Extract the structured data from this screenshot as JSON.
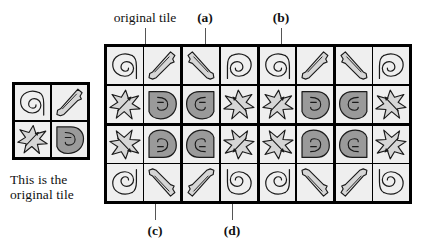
{
  "figure": {
    "legend": {
      "caption_line1": "This is the",
      "caption_line2": "original tile",
      "caption": "This is the original tile",
      "tile_cells": [
        {
          "glyph": "spiral",
          "fill": "light",
          "rot": 0,
          "flipx": false,
          "flipy": false
        },
        {
          "glyph": "bone",
          "fill": "light",
          "rot": 0,
          "flipx": false,
          "flipy": false
        },
        {
          "glyph": "star",
          "fill": "light",
          "rot": 0,
          "flipx": false,
          "flipy": false
        },
        {
          "glyph": "leaf",
          "fill": "dark",
          "rot": 0,
          "flipx": false,
          "flipy": false
        }
      ]
    },
    "labels": {
      "original_tile": "original tile",
      "a": "(a)",
      "b": "(b)",
      "c": "(c)",
      "d": "(d)"
    },
    "colors": {
      "light_fill": "#d6d6d6",
      "dark_fill": "#9a9a9a",
      "outline": "#1a1a1a",
      "cell_bg": "#efefef",
      "grid_line": "#000000",
      "page_bg": "#ffffff",
      "text": "#111111",
      "leader": "#555555"
    },
    "grid": {
      "rows_of_blocks": 2,
      "cols_of_blocks": 4,
      "block_rows": 2,
      "block_cols": 2,
      "total_cells": 32,
      "description": "Wallpaper pattern built by reflecting a 2x2 original tile horizontally and vertically",
      "blocks": [
        {
          "id": "block-r1c1",
          "flipx": false,
          "flipy": false
        },
        {
          "id": "block-r1c2",
          "flipx": true,
          "flipy": false
        },
        {
          "id": "block-r1c3",
          "flipx": false,
          "flipy": false
        },
        {
          "id": "block-r1c4",
          "flipx": true,
          "flipy": false
        },
        {
          "id": "block-r2c1",
          "flipx": false,
          "flipy": true
        },
        {
          "id": "block-r2c2",
          "flipx": true,
          "flipy": true
        },
        {
          "id": "block-r2c3",
          "flipx": false,
          "flipy": true
        },
        {
          "id": "block-r2c4",
          "flipx": true,
          "flipy": true
        }
      ],
      "tile_cells": [
        {
          "glyph": "spiral",
          "fill": "light"
        },
        {
          "glyph": "bone",
          "fill": "light"
        },
        {
          "glyph": "star",
          "fill": "light"
        },
        {
          "glyph": "leaf",
          "fill": "dark"
        }
      ]
    },
    "leaders": [
      {
        "name": "original-tile",
        "label": "original tile",
        "side": "top",
        "x": 145,
        "top": 28,
        "len": 16
      },
      {
        "name": "a",
        "label": "(a)",
        "side": "top",
        "x": 205,
        "top": 28,
        "len": 16
      },
      {
        "name": "b",
        "label": "(b)",
        "side": "top",
        "x": 281,
        "top": 28,
        "len": 16
      },
      {
        "name": "c",
        "label": "(c)",
        "side": "bottom",
        "x": 155,
        "top": 204,
        "len": 16
      },
      {
        "name": "d",
        "label": "(d)",
        "side": "bottom",
        "x": 232,
        "top": 204,
        "len": 16
      }
    ]
  }
}
